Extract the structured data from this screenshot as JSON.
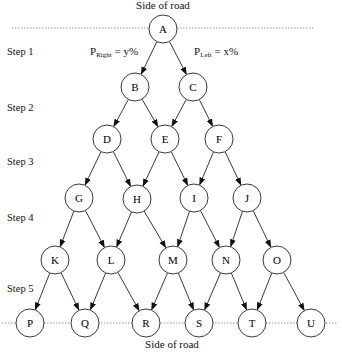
{
  "diagram": {
    "top_road_label": "Side of road",
    "bottom_road_label": "Side of road",
    "steps": [
      {
        "label": "Step 1",
        "y": 53
      },
      {
        "label": "Step 2",
        "y": 109
      },
      {
        "label": "Step 3",
        "y": 163
      },
      {
        "label": "Step 4",
        "y": 219
      },
      {
        "label": "Step 5",
        "y": 290
      }
    ],
    "probabilities": {
      "right": {
        "symbol": "P",
        "subscript": "Right",
        "value": "= y%"
      },
      "left": {
        "symbol": "P",
        "subscript": "Left",
        "value": "= x%"
      }
    },
    "node_radius": 14,
    "nodes": [
      {
        "id": "A",
        "x": 163,
        "y": 29
      },
      {
        "id": "B",
        "x": 135,
        "y": 87
      },
      {
        "id": "C",
        "x": 193,
        "y": 87
      },
      {
        "id": "D",
        "x": 107,
        "y": 139
      },
      {
        "id": "E",
        "x": 165,
        "y": 139
      },
      {
        "id": "F",
        "x": 219,
        "y": 139
      },
      {
        "id": "G",
        "x": 79,
        "y": 198
      },
      {
        "id": "H",
        "x": 137,
        "y": 199
      },
      {
        "id": "I",
        "x": 194,
        "y": 198
      },
      {
        "id": "J",
        "x": 247,
        "y": 198
      },
      {
        "id": "K",
        "x": 55,
        "y": 260
      },
      {
        "id": "L",
        "x": 111,
        "y": 260
      },
      {
        "id": "M",
        "x": 173,
        "y": 260
      },
      {
        "id": "N",
        "x": 226,
        "y": 260
      },
      {
        "id": "O",
        "x": 277,
        "y": 260
      },
      {
        "id": "P",
        "x": 30,
        "y": 323
      },
      {
        "id": "Q",
        "x": 85,
        "y": 323
      },
      {
        "id": "R",
        "x": 146,
        "y": 323
      },
      {
        "id": "S",
        "x": 199,
        "y": 323
      },
      {
        "id": "T",
        "x": 252,
        "y": 323
      },
      {
        "id": "U",
        "x": 311,
        "y": 323
      }
    ],
    "edges": [
      [
        "A",
        "B"
      ],
      [
        "A",
        "C"
      ],
      [
        "B",
        "D"
      ],
      [
        "B",
        "E"
      ],
      [
        "C",
        "E"
      ],
      [
        "C",
        "F"
      ],
      [
        "D",
        "G"
      ],
      [
        "D",
        "H"
      ],
      [
        "E",
        "H"
      ],
      [
        "E",
        "I"
      ],
      [
        "F",
        "I"
      ],
      [
        "F",
        "J"
      ],
      [
        "G",
        "K"
      ],
      [
        "G",
        "L"
      ],
      [
        "H",
        "L"
      ],
      [
        "H",
        "M"
      ],
      [
        "I",
        "M"
      ],
      [
        "I",
        "N"
      ],
      [
        "J",
        "N"
      ],
      [
        "J",
        "O"
      ],
      [
        "K",
        "P"
      ],
      [
        "K",
        "Q"
      ],
      [
        "L",
        "Q"
      ],
      [
        "L",
        "R"
      ],
      [
        "M",
        "R"
      ],
      [
        "M",
        "S"
      ],
      [
        "N",
        "S"
      ],
      [
        "N",
        "T"
      ],
      [
        "O",
        "T"
      ],
      [
        "O",
        "U"
      ]
    ],
    "road_lines": [
      {
        "name": "top",
        "x1": 12,
        "x2": 315,
        "y": 28
      },
      {
        "name": "bottom",
        "x1": 2,
        "x2": 338,
        "y": 323
      }
    ],
    "colors": {
      "stroke": "#222222",
      "road_line": "#777777",
      "node_fill": "#ffffff"
    }
  }
}
